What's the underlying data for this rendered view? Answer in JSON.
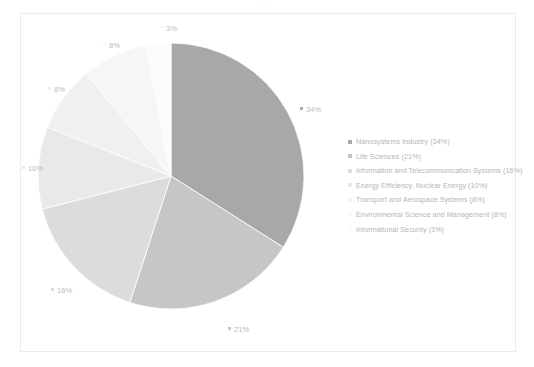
{
  "figure": {
    "title_remnant": "·  ·  ·",
    "background_color": "#ffffff",
    "frame_border_color": "#ececed"
  },
  "chart_data": {
    "type": "pie",
    "title": "",
    "xlabel": "",
    "ylabel": "",
    "grid": false,
    "legend_position": "right",
    "start_angle_deg": 0,
    "direction": "clockwise",
    "categories": [
      "Nanosystems Industry",
      "Life Sciences",
      "Information and Telecommunication Systems",
      "Energy Efficiency, Nuclear Energy",
      "Transport and Aerospace Systems",
      "Environmental Science and Management",
      "Informational Security"
    ],
    "values": [
      34,
      21,
      16,
      10,
      8,
      8,
      3
    ],
    "value_unit": "%",
    "colors": [
      "#a8a8a9",
      "#c6c6c7",
      "#dcdcdd",
      "#e9e9ea",
      "#f0f0f1",
      "#f6f6f7",
      "#fbfbfc"
    ],
    "legend_entries": [
      "Nanosystems Industry (34%)",
      "Life Sciences (21%)",
      "Information and Telecommunication Systems (16%)",
      "Energy Efficiency, Nuclear Energy (10%)",
      "Transport and Aerospace Systems (8%)",
      "Environmental Science and Management (8%)",
      "Informational Security (3%)"
    ],
    "data_labels": [
      {
        "text": "34%",
        "x": 300,
        "y": 104
      },
      {
        "text": "21%",
        "x": 228,
        "y": 324
      },
      {
        "text": "16%",
        "x": 51,
        "y": 285
      },
      {
        "text": "10%",
        "x": 22,
        "y": 163
      },
      {
        "text": "8%",
        "x": 48,
        "y": 84
      },
      {
        "text": "8%",
        "x": 103,
        "y": 40
      },
      {
        "text": "3%",
        "x": 160,
        "y": 23
      }
    ]
  }
}
